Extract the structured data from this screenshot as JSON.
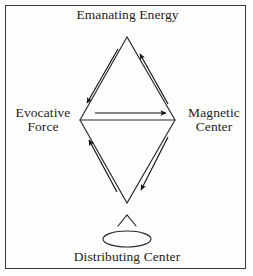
{
  "figure": {
    "type": "esoteric-energy-diamond-diagram",
    "background_color": "#fdfdfb",
    "frame_color": "#3a3a3a",
    "ink_color": "#1d1d1d",
    "labels": {
      "top": "Emanating Energy",
      "left": "Evocative\nForce",
      "right": "Magnetic\nCenter",
      "bottom": "Distributing Center"
    },
    "nodes": [
      {
        "id": "top",
        "label": "Emanating Energy",
        "x": 127,
        "y": 37
      },
      {
        "id": "left",
        "label": "Evocative Force",
        "x": 80,
        "y": 120
      },
      {
        "id": "right",
        "label": "Magnetic Center",
        "x": 175,
        "y": 120
      },
      {
        "id": "bottom",
        "label": "Distributing Center",
        "x": 127,
        "y": 203
      }
    ],
    "edges": [
      {
        "from": "top",
        "to": "left",
        "shape": "line"
      },
      {
        "from": "top",
        "to": "right",
        "shape": "line"
      },
      {
        "from": "left",
        "to": "right",
        "shape": "line"
      },
      {
        "from": "left",
        "to": "bottom",
        "shape": "line"
      },
      {
        "from": "right",
        "to": "bottom",
        "shape": "line"
      }
    ],
    "flow_arrows": [
      {
        "id": "top-left-down",
        "direction": "down-left",
        "alongside": "top-left-edge",
        "from": "top",
        "to": "left"
      },
      {
        "id": "bottom-right-up",
        "direction": "up-right",
        "alongside": "top-right-edge",
        "from": "right",
        "to": "top"
      },
      {
        "id": "middle-right",
        "direction": "right",
        "alongside": "horizontal-axis",
        "from": "left",
        "to": "right"
      },
      {
        "id": "bottom-left-up",
        "direction": "up-left",
        "alongside": "bottom-left-edge",
        "from": "bottom",
        "to": "left"
      },
      {
        "id": "right-bottom-down",
        "direction": "down-right",
        "alongside": "bottom-right-edge",
        "from": "right",
        "to": "bottom"
      }
    ],
    "bottom_glyphs": {
      "caret": {
        "x": 127,
        "y": 215,
        "half_width": 9,
        "height": 11
      },
      "ellipse": {
        "cx": 127,
        "cy": 239,
        "rx": 24,
        "ry": 8
      }
    }
  }
}
